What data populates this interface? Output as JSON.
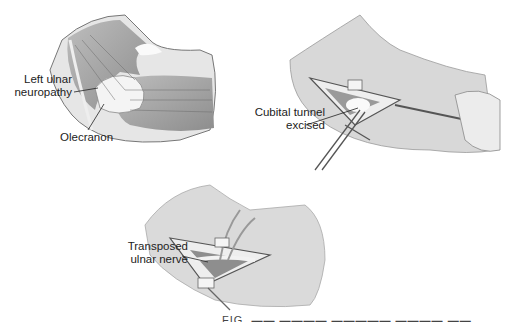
{
  "figure": {
    "panels": [
      {
        "id": "panel-1",
        "description": "Elbow anatomy showing ulnar nerve over olecranon",
        "labels": [
          {
            "line1": "Left ulnar",
            "line2": "neuropathy"
          },
          {
            "line1": "Olecranon"
          }
        ]
      },
      {
        "id": "panel-2",
        "description": "Surgical incision with retractors and scissors",
        "labels": [
          {
            "line1": "Cubital tunnel",
            "line2": "excised"
          }
        ]
      },
      {
        "id": "panel-3",
        "description": "Incision with nerve transposed by vessel loops",
        "labels": [
          {
            "line1": "Transposed",
            "line2": "ulnar nerve"
          }
        ]
      }
    ],
    "caption": "FIG. ▬▬ ▬▬▬▬  ▬▬▬▬▬  ▬▬▬▬  ▬▬"
  },
  "colors": {
    "skin": "#d6d6d6",
    "muscle": "#8a8a8a",
    "outline": "#555555",
    "text": "#222222"
  }
}
